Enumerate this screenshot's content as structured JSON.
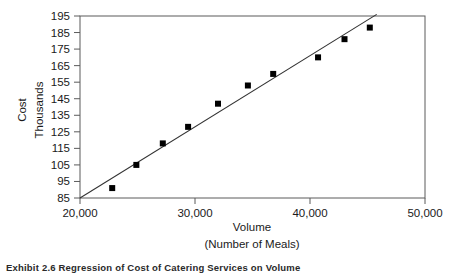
{
  "chart_data": {
    "type": "scatter",
    "title": "",
    "xlabel": "Volume",
    "xlabel2": "(Number of Meals)",
    "ylabel": "Cost",
    "ylabel2": "Thousands",
    "xlim": [
      20000,
      50000
    ],
    "ylim": [
      85,
      195
    ],
    "xticks": [
      20000,
      30000,
      40000,
      50000
    ],
    "xtick_labels": [
      "20,000",
      "30,000",
      "40,000",
      "50,000"
    ],
    "yticks": [
      85,
      95,
      105,
      115,
      125,
      135,
      145,
      155,
      165,
      175,
      185,
      195
    ],
    "ytick_labels": [
      "85",
      "95",
      "105",
      "115",
      "125",
      "135",
      "145",
      "155",
      "165",
      "175",
      "185",
      "195"
    ],
    "grid": false,
    "legend": null,
    "marker": "square",
    "marker_color": "#000000",
    "line_color": "#333333",
    "points": [
      {
        "x": 22800,
        "y": 91
      },
      {
        "x": 24900,
        "y": 105
      },
      {
        "x": 27200,
        "y": 118
      },
      {
        "x": 29400,
        "y": 128
      },
      {
        "x": 32000,
        "y": 142
      },
      {
        "x": 34600,
        "y": 153
      },
      {
        "x": 36800,
        "y": 160
      },
      {
        "x": 40700,
        "y": 170
      },
      {
        "x": 43000,
        "y": 181
      },
      {
        "x": 45200,
        "y": 188
      }
    ],
    "trendline": {
      "name": "regression-line",
      "x0": 20000,
      "y0": 85,
      "x1": 45800,
      "y1": 196
    }
  },
  "caption": {
    "text": "Exhibit 2.6  Regression of Cost of Catering Services on Volume"
  }
}
